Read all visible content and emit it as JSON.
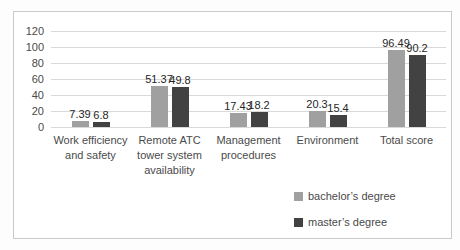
{
  "chart_data": {
    "type": "bar",
    "title": "",
    "categories": [
      "Work efficiency and safety",
      "Remote ATC tower system availability",
      "Management procedures",
      "Environment",
      "Total score"
    ],
    "series": [
      {
        "name": "bachelor’s degree",
        "color": "#a0a0a0",
        "values": [
          7.39,
          51.37,
          17.43,
          20.3,
          96.49
        ],
        "value_labels": [
          "7.39",
          "51.37",
          "17.43",
          "20.3",
          "96.49"
        ]
      },
      {
        "name": "master’s degree",
        "color": "#424242",
        "values": [
          6.8,
          49.8,
          18.2,
          15.4,
          90.2
        ],
        "value_labels": [
          "6.8",
          "49.8",
          "18.2",
          "15.4",
          "90.2"
        ]
      }
    ],
    "xlabel": "",
    "ylabel": "",
    "ylim": [
      0,
      120
    ],
    "yticks": [
      "0",
      "20",
      "40",
      "60",
      "80",
      "100",
      "120"
    ],
    "grid": true,
    "legend_position": "bottom-right"
  },
  "colors": {
    "background": "#ffffff",
    "frame_border": "#c9c9c9",
    "gridline": "#d9d9d9",
    "axis_text": "#4a4a4a",
    "value_label_text": "#262626",
    "series_bachelor": "#a0a0a0",
    "series_master": "#424242"
  }
}
